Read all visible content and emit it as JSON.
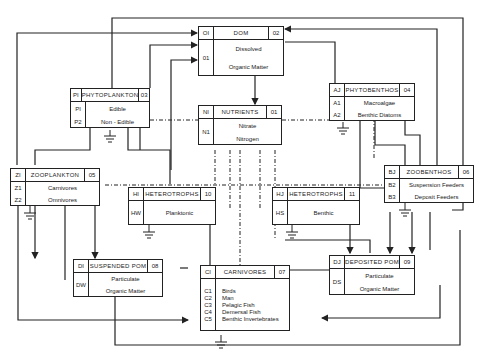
{
  "boxes": {
    "dom": {
      "in_code": "OI",
      "title": "DOM",
      "num": "02",
      "codes": [
        "01"
      ],
      "lines": [
        "Dissolved",
        "Organic Matter"
      ]
    },
    "phytoplankton": {
      "in_code": "PI",
      "title": "PHYTOPLANKTON",
      "num": "03",
      "codes": [
        "PI",
        "P2"
      ],
      "lines": [
        "Edible",
        "Non - Edible"
      ]
    },
    "phytobenthos": {
      "in_code": "AJ",
      "title": "PHYTOBENTHOS",
      "num": "04",
      "codes": [
        "A1",
        "A2"
      ],
      "lines": [
        "Macroalgae",
        "Benthic  Diatoms"
      ]
    },
    "nutrients": {
      "in_code": "NI",
      "title": "NUTRIENTS",
      "num": "01",
      "codes": [
        "N1"
      ],
      "lines": [
        "Nitrate",
        "Nitrogen"
      ]
    },
    "zooplankton": {
      "in_code": "ZI",
      "title": "ZOOPLANKTON",
      "num": "05",
      "codes": [
        "Z1",
        "Z2"
      ],
      "lines": [
        "Carnivores",
        "Omnivores"
      ]
    },
    "heterotrophs10": {
      "in_code": "HI",
      "title": "HETEROTROPHS",
      "num": "10",
      "codes": [
        "HW"
      ],
      "lines": [
        "Planktonic"
      ]
    },
    "heterotrophs11": {
      "in_code": "HJ",
      "title": "HETEROTROPHS",
      "num": "11",
      "codes": [
        "HS"
      ],
      "lines": [
        "Benthic"
      ]
    },
    "zoobenthos": {
      "in_code": "BJ",
      "title": "ZOOBENTHOS",
      "num": "06",
      "codes": [
        "B2",
        "B3"
      ],
      "lines": [
        "Suspension Feeders",
        "Deposit Feeders"
      ]
    },
    "suspended_pom": {
      "in_code": "DI",
      "title": "SUSPENDED POM",
      "num": "08",
      "codes": [
        "DW"
      ],
      "lines": [
        "Particulate",
        "Organic Matter"
      ]
    },
    "carnivores": {
      "in_code": "CI",
      "title": "CARNIVORES",
      "num": "07",
      "codes": [
        "C1",
        "C2",
        "C3",
        "C4",
        "C5"
      ],
      "lines": [
        "Birds",
        "Man",
        "Pelagic Fish",
        "Demersal Fish",
        "Benthic Invertebrates"
      ]
    },
    "deposited_pom": {
      "in_code": "DJ",
      "title": "DEPOSITED POM",
      "num": "09",
      "codes": [
        "DS"
      ],
      "lines": [
        "Particulate",
        "Organic Matter"
      ]
    }
  },
  "colors": {
    "line": "#222222",
    "background": "#ffffff"
  }
}
